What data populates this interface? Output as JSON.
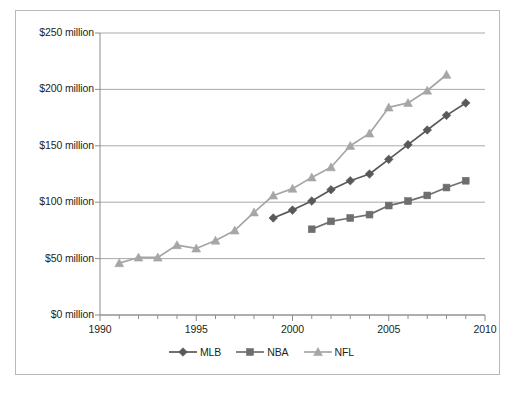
{
  "chart_data": {
    "type": "line",
    "title": "",
    "subtitle": "",
    "xlabel": "",
    "ylabel": "",
    "xlim": [
      1990,
      2010
    ],
    "ylim": [
      0,
      250
    ],
    "grid": true,
    "legend_position": "bottom",
    "x_tick_labels": [
      "1990",
      "1995",
      "2000",
      "2005",
      "2010"
    ],
    "x_tick_values": [
      1990,
      1995,
      2000,
      2005,
      2010
    ],
    "x_minor_tick_step": 1,
    "y_tick_labels": [
      "$0 million",
      "$50 million",
      "$100 million",
      "$150 million",
      "$200 million",
      "$250 million"
    ],
    "y_tick_values": [
      0,
      50,
      100,
      150,
      200,
      250
    ],
    "units": "million USD",
    "series": [
      {
        "name": "MLB",
        "marker": "diamond",
        "color": "#595959",
        "x": [
          1999,
          2000,
          2001,
          2002,
          2003,
          2004,
          2005,
          2006,
          2007,
          2008,
          2009
        ],
        "values": [
          86,
          93,
          101,
          111,
          119,
          125,
          138,
          151,
          164,
          177,
          188
        ]
      },
      {
        "name": "NBA",
        "marker": "square",
        "color": "#6e6e6e",
        "x": [
          2001,
          2002,
          2003,
          2004,
          2005,
          2006,
          2007,
          2008,
          2009
        ],
        "values": [
          76,
          83,
          86,
          89,
          97,
          101,
          106,
          113,
          119
        ]
      },
      {
        "name": "NFL",
        "marker": "triangle",
        "color": "#a6a6a6",
        "x": [
          1991,
          1992,
          1993,
          1994,
          1995,
          1996,
          1997,
          1998,
          1999,
          2000,
          2001,
          2002,
          2003,
          2004,
          2005,
          2006,
          2007,
          2008
        ],
        "values": [
          46,
          51,
          51,
          62,
          59,
          66,
          75,
          91,
          106,
          112,
          122,
          131,
          150,
          161,
          184,
          188,
          199,
          213
        ]
      }
    ]
  },
  "legend": {
    "entries": [
      {
        "label": "MLB"
      },
      {
        "label": "NBA"
      },
      {
        "label": "NFL"
      }
    ]
  },
  "colors": {
    "mlb": "#595959",
    "nba": "#6e6e6e",
    "nfl": "#a6a6a6",
    "gridline": "#9f9f9f",
    "axis": "#8c8c8c",
    "frame": "#b9b9b9",
    "text": "#231f20",
    "background": "#ffffff"
  }
}
